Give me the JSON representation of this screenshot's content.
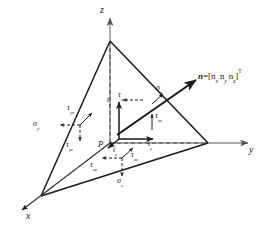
{
  "figure": {
    "background_color": "#ffffff",
    "line_color": "#1a1a1a",
    "dashed_color": "#555555"
  },
  "axes": {
    "x_label": "x",
    "y_label": "y",
    "z_label": "z"
  },
  "point": {
    "origin_label": "P"
  },
  "normal": {
    "symbol": "n",
    "equals": "=[",
    "nx": "n",
    "nx_sub": "x",
    "ny": "n",
    "ny_sub": "y",
    "nz": "n",
    "nz_sub": "z",
    "close": "]",
    "transpose": "T",
    "full_text": "n=[n_x n_y n_z]^T"
  },
  "traction": {
    "tx": {
      "base": "t",
      "sub": "x"
    },
    "ty": {
      "base": "t",
      "sub": "y"
    },
    "tz": {
      "base": "t",
      "sub": "z"
    }
  },
  "stresses": {
    "sigma_x": {
      "base": "σ",
      "sub": "x"
    },
    "sigma_y": {
      "base": "σ",
      "sub": "y"
    },
    "sigma_z": {
      "base": "σ",
      "sub": "z"
    },
    "tau_xy": {
      "base": "τ",
      "sub": "xy"
    },
    "tau_xz": {
      "base": "τ",
      "sub": "xz"
    },
    "tau_yx": {
      "base": "τ",
      "sub": "yx"
    },
    "tau_yz": {
      "base": "τ",
      "sub": "yz"
    },
    "tau_zx": {
      "base": "τ",
      "sub": "zx"
    },
    "tau_zy": {
      "base": "τ",
      "sub": "zy"
    }
  }
}
